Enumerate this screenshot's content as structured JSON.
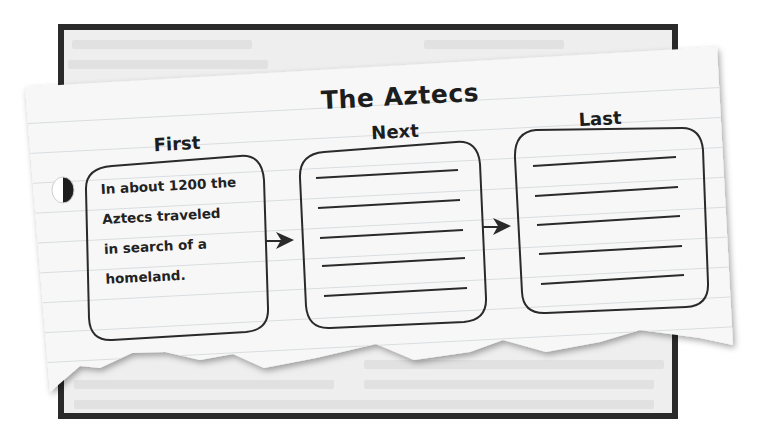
{
  "organizer": {
    "title": "The Aztecs",
    "type": "sequence-chart",
    "columns": [
      {
        "label": "First",
        "text_lines": [
          "In about 1200 the",
          "Aztecs traveled",
          "in search of a",
          "homeland."
        ],
        "blank_lines": 0
      },
      {
        "label": "Next",
        "text_lines": [],
        "blank_lines": 5
      },
      {
        "label": "Last",
        "text_lines": [],
        "blank_lines": 5
      }
    ],
    "arrows": [
      {
        "from": "First",
        "to": "Next"
      },
      {
        "from": "Next",
        "to": "Last"
      }
    ]
  },
  "colors": {
    "frame": "#2a2a2a",
    "book_page": "#eeeeee",
    "notepaper": "#f7f7f7",
    "ruled_line": "#d9dde0",
    "ink": "#1d1d1d"
  }
}
